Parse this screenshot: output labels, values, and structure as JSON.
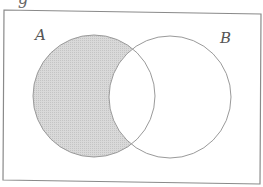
{
  "diagram": {
    "type": "venn",
    "cut_off_text": "g",
    "universe": {
      "corners": {
        "top_left": [
          4,
          10
        ],
        "top_right": [
          261,
          14
        ],
        "bottom_right": [
          260,
          184
        ],
        "bottom_left": [
          3,
          180
        ]
      },
      "stroke": "#8a8a8a"
    },
    "sets": [
      {
        "label": "A",
        "cx": 94,
        "cy": 96,
        "r": 61,
        "label_x": 35,
        "label_y": 40
      },
      {
        "label": "B",
        "cx": 170,
        "cy": 97,
        "r": 61,
        "label_x": 220,
        "label_y": 43
      }
    ],
    "shaded_region": "A minus B",
    "colors": {
      "shade": "#d6d6d6",
      "shade_dot": "#c2c2c2",
      "circle_stroke": "#9a9a9a",
      "background": "#ffffff"
    }
  }
}
